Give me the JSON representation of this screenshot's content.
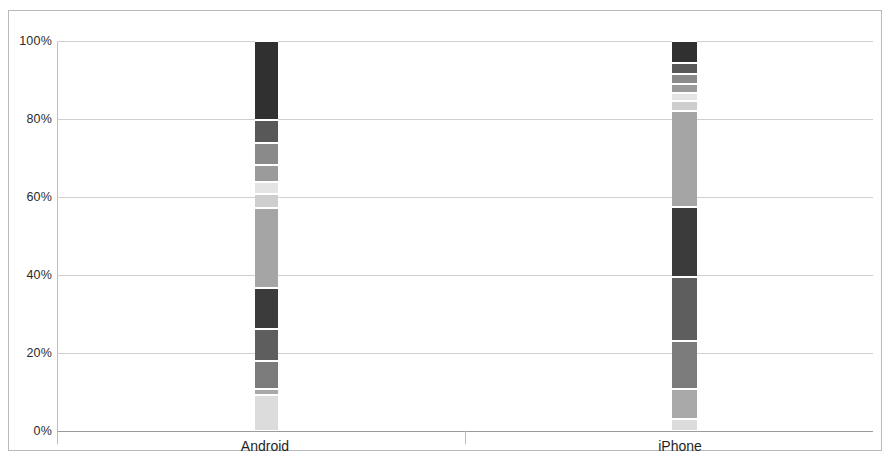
{
  "chart_data": {
    "type": "bar",
    "subtype": "stacked-percentage",
    "title": "",
    "subtitle": "",
    "xlabel": "",
    "ylabel": "",
    "categories": [
      "Android",
      "iPhone"
    ],
    "ylim": [
      0,
      100
    ],
    "ytick_labels": [
      "0%",
      "20%",
      "40%",
      "60%",
      "80%",
      "100%"
    ],
    "ytick_values": [
      0,
      20,
      40,
      60,
      80,
      100
    ],
    "grid": true,
    "legend": "none",
    "orientation": "vertical",
    "series": [
      {
        "name": "Segment 1",
        "color": "#dcdcdc",
        "values": [
          9.2,
          3.1
        ]
      },
      {
        "name": "Segment 2",
        "color": "#a8a8a8",
        "values": [
          1.5,
          7.7
        ]
      },
      {
        "name": "Segment 3",
        "color": "#7b7b7b",
        "values": [
          7.2,
          12.3
        ]
      },
      {
        "name": "Segment 4",
        "color": "#5e5e5e",
        "values": [
          8.2,
          16.4
        ]
      },
      {
        "name": "Segment 5",
        "color": "#3b3b3b",
        "values": [
          10.5,
          17.9
        ]
      },
      {
        "name": "Segment 6",
        "color": "#a5a5a5",
        "values": [
          20.5,
          24.6
        ]
      },
      {
        "name": "Segment 7",
        "color": "#cecece",
        "values": [
          3.6,
          2.6
        ]
      },
      {
        "name": "Segment 8",
        "color": "#e4e4e4",
        "values": [
          3.1,
          2.1
        ]
      },
      {
        "name": "Segment 9",
        "color": "#9b9b9b",
        "values": [
          4.4,
          2.3
        ]
      },
      {
        "name": "Segment 10",
        "color": "#8a8a8a",
        "values": [
          5.6,
          2.6
        ]
      },
      {
        "name": "Segment 11",
        "color": "#585858",
        "values": [
          5.9,
          2.8
        ]
      },
      {
        "name": "Segment 12",
        "color": "#303030",
        "values": [
          20.3,
          5.6
        ]
      }
    ]
  },
  "axis": {
    "y_labels": [
      "100%",
      "80%",
      "60%",
      "40%",
      "20%",
      "0%"
    ]
  },
  "categories": {
    "android_label": "Android",
    "iphone_label": "iPhone"
  },
  "colors": {
    "grid": "#cfcfcf",
    "axis": "#9a9a9a",
    "frame": "#b9b9b9",
    "background": "#ffffff",
    "text": "#1f1f1f"
  }
}
